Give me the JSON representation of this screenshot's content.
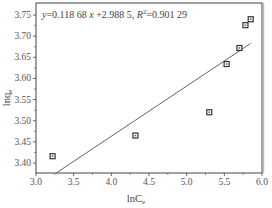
{
  "chart_data": {
    "type": "scatter",
    "title": "",
    "xlabel": "lnCe",
    "xlabel_main": "lnC",
    "xlabel_sub": "e",
    "ylabel": "lnqe",
    "ylabel_main": "lnq",
    "ylabel_sub": "e",
    "xlim": [
      3.0,
      6.0
    ],
    "ylim": [
      3.375,
      3.765
    ],
    "x_ticks": [
      3.0,
      3.5,
      4.0,
      4.5,
      5.0,
      5.5,
      6.0
    ],
    "x_tick_labels": [
      "3.0",
      "3.5",
      "4.0",
      "4.5",
      "5.0",
      "5.5",
      "6.0"
    ],
    "y_ticks": [
      3.4,
      3.45,
      3.5,
      3.55,
      3.6,
      3.65,
      3.7,
      3.75
    ],
    "y_tick_labels": [
      "3.40",
      "3.45",
      "3.50",
      "3.55",
      "3.60",
      "3.65",
      "3.70",
      "3.75"
    ],
    "grid": false,
    "legend": null,
    "series": [
      {
        "name": "data",
        "marker": "square",
        "x": [
          3.22,
          4.32,
          5.3,
          5.53,
          5.7,
          5.78,
          5.85
        ],
        "y": [
          3.416,
          3.465,
          3.52,
          3.634,
          3.672,
          3.726,
          3.74
        ]
      },
      {
        "name": "linear fit",
        "line": true,
        "slope": 0.11868,
        "intercept": 2.9885,
        "x_range": [
          3.27,
          5.85
        ]
      }
    ],
    "annotations": [
      {
        "text": "y=0.118 68 x +2.988 5, R²=0.901 29",
        "position": "top-left"
      }
    ]
  },
  "equation": {
    "y": "y",
    "eq1": "=0.118 68 ",
    "x": "x",
    "eq2": " +2.988 5, ",
    "r": "R",
    "sup": "2",
    "eq3": "=0.901 29"
  }
}
